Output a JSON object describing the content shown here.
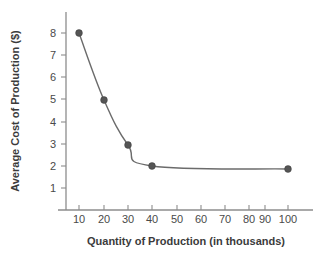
{
  "chart_data": {
    "type": "line",
    "title": "",
    "xlabel": "Quantity of Production (in thousands)",
    "ylabel": "Average Cost of Production ($)",
    "x": [
      10,
      20,
      30,
      40,
      100
    ],
    "values": [
      8.0,
      4.9,
      2.9,
      1.95,
      1.8
    ],
    "series": [
      {
        "name": "Average Cost of Production",
        "values": [
          8.0,
          4.9,
          2.9,
          1.95,
          1.8
        ]
      }
    ],
    "xtick_labels": [
      "10",
      "20",
      "30",
      "40",
      "50",
      "60",
      "70",
      "80",
      "90",
      "100"
    ],
    "xtick_values": [
      10,
      20,
      30,
      40,
      50,
      60,
      70,
      80,
      90,
      100
    ],
    "ytick_labels": [
      "1",
      "2",
      "3",
      "4",
      "5",
      "6",
      "7",
      "8"
    ],
    "ytick_values": [
      1,
      2,
      3,
      4,
      5,
      6,
      7,
      8
    ],
    "xlim": [
      0,
      110
    ],
    "ylim": [
      0,
      9
    ],
    "x_scale": "categorical-even",
    "grid": false,
    "legend": "none",
    "marker": "filled-circle",
    "marker_color": "#555555",
    "line_color": "#6b6b6b",
    "axis_color": "#8d8d8d",
    "background_color": "#ffffff"
  },
  "axis": {
    "x_title": "Quantity of Production (in thousands)",
    "y_title": "Average Cost of Production ($)"
  },
  "xticks": [
    {
      "label": "10",
      "px": 79
    },
    {
      "label": "20",
      "px": 104
    },
    {
      "label": "30",
      "px": 128
    },
    {
      "label": "40",
      "px": 152
    },
    {
      "label": "50",
      "px": 177
    },
    {
      "label": "60",
      "px": 201
    },
    {
      "label": "70",
      "px": 225
    },
    {
      "label": "80",
      "px": 249
    },
    {
      "label": "90",
      "px": 265
    },
    {
      "label": "100",
      "px": 288
    }
  ],
  "yticks": [
    {
      "label": "8",
      "px": 33
    },
    {
      "label": "7",
      "px": 55
    },
    {
      "label": "6",
      "px": 77
    },
    {
      "label": "5",
      "px": 99
    },
    {
      "label": "4",
      "px": 122
    },
    {
      "label": "3",
      "px": 144
    },
    {
      "label": "2",
      "px": 166
    },
    {
      "label": "1",
      "px": 188
    }
  ],
  "points": [
    {
      "x_label": "10",
      "y_value": "8.0",
      "cx": 79,
      "cy": 33
    },
    {
      "x_label": "20",
      "y_value": "4.9",
      "cx": 104,
      "cy": 100
    },
    {
      "x_label": "30",
      "y_value": "2.9",
      "cx": 128,
      "cy": 145
    },
    {
      "x_label": "40",
      "y_value": "1.95",
      "cx": 152,
      "cy": 166
    },
    {
      "x_label": "100",
      "y_value": "1.8",
      "cx": 288,
      "cy": 169
    }
  ]
}
